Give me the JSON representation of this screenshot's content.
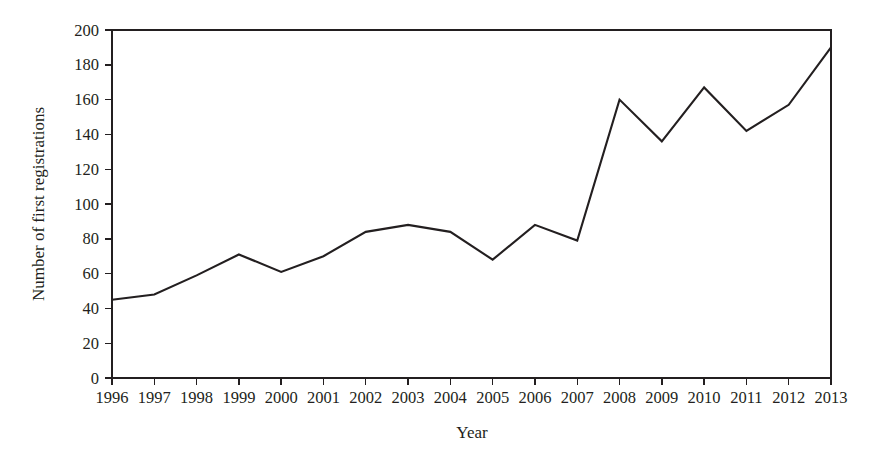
{
  "chart_data": {
    "type": "line",
    "title": "",
    "subtitle": "",
    "xlabel": "Year",
    "ylabel": "Number of first registrations",
    "categories": [
      "1996",
      "1997",
      "1998",
      "1999",
      "2000",
      "2001",
      "2002",
      "2003",
      "2004",
      "2005",
      "2006",
      "2007",
      "2008",
      "2009",
      "2010",
      "2011",
      "2012",
      "2013"
    ],
    "x": [
      1996,
      1997,
      1998,
      1999,
      2000,
      2001,
      2002,
      2003,
      2004,
      2005,
      2006,
      2007,
      2008,
      2009,
      2010,
      2011,
      2012,
      2013
    ],
    "values": [
      45,
      48,
      59,
      71,
      61,
      70,
      84,
      88,
      84,
      68,
      88,
      79,
      160,
      136,
      167,
      142,
      157,
      190
    ],
    "series": [
      {
        "name": "Number of first registrations",
        "values": [
          45,
          48,
          59,
          71,
          61,
          70,
          84,
          88,
          84,
          68,
          88,
          79,
          160,
          136,
          167,
          142,
          157,
          190
        ]
      }
    ],
    "ylim": [
      0,
      200
    ],
    "xlim": [
      1996,
      2013
    ],
    "yticks": [
      0,
      20,
      40,
      60,
      80,
      100,
      120,
      140,
      160,
      180,
      200
    ],
    "ytick_labels": [
      "0",
      "20",
      "40",
      "60",
      "80",
      "100",
      "120",
      "140",
      "160",
      "180",
      "200"
    ],
    "xticks": [
      1996,
      1997,
      1998,
      1999,
      2000,
      2001,
      2002,
      2003,
      2004,
      2005,
      2006,
      2007,
      2008,
      2009,
      2010,
      2011,
      2012,
      2013
    ],
    "xtick_labels": [
      "1996",
      "1997",
      "1998",
      "1999",
      "2000",
      "2001",
      "2002",
      "2003",
      "2004",
      "2005",
      "2006",
      "2007",
      "2008",
      "2009",
      "2010",
      "2011",
      "2012",
      "2013"
    ],
    "grid": false,
    "legend": false,
    "legend_position": "none",
    "line_color": "#231f20",
    "background_color": "#ffffff",
    "annotations": []
  }
}
